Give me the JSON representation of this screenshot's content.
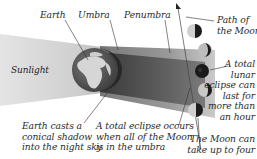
{
  "diagram": {
    "title": "Lunar eclipse",
    "labels": {
      "earth": "Earth",
      "umbra": "Umbra",
      "penumbra": "Penumbra",
      "path": [
        "Path of",
        "the Moon"
      ],
      "sunlight": "Sunlight",
      "total_lasts": [
        "A total",
        "lunar",
        "eclipse can",
        "last for",
        "more than",
        "an hour"
      ],
      "earth_casts": [
        "Earth casts a",
        "conical shadow",
        "into the night sky"
      ],
      "total_occurs": [
        "A total eclipse occurs",
        "when all of the Moon",
        "is in the umbra"
      ],
      "moon_can": [
        "The Moon can",
        "take up to four"
      ]
    },
    "icons": {
      "earth": "earth-globe-icon",
      "moon_phases": [
        "moon-partial-icon",
        "moon-partial-icon",
        "moon-total-icon",
        "moon-partial-icon",
        "moon-partial-icon"
      ],
      "path_arrow": "arrow-up-left-icon"
    },
    "colors": {
      "sunlight_beam": "#d9d9d9",
      "penumbra": "#8a8a8a",
      "umbra": "#3c3c3c",
      "earth_ocean": "#5a5a5a",
      "earth_land": "#d8d8d8",
      "text": "#2a2a2a"
    }
  }
}
